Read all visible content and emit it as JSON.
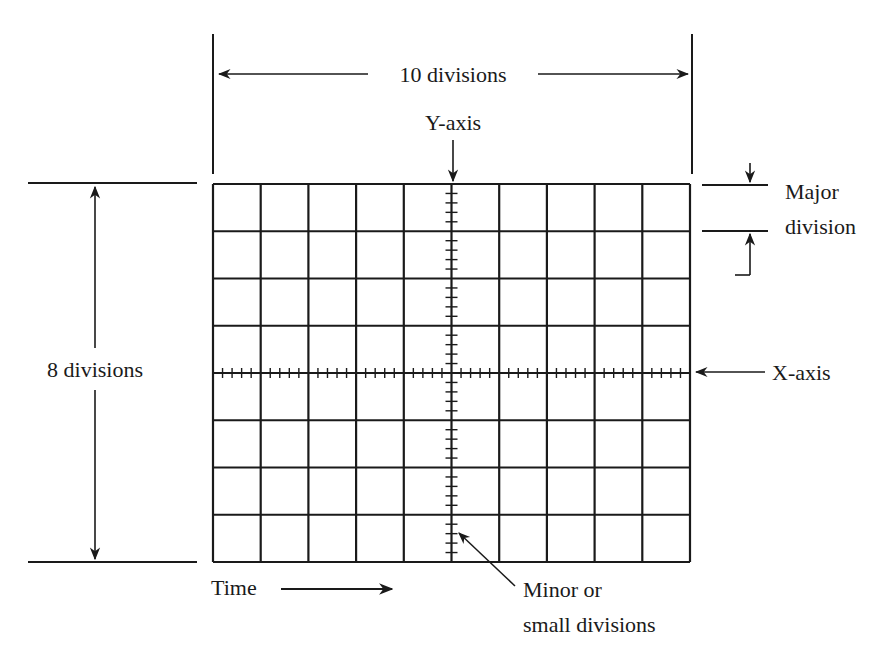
{
  "diagram": {
    "type": "oscilloscope-graticule",
    "grid": {
      "major_divisions_x": 10,
      "major_divisions_y": 8,
      "minor_per_major": 5
    },
    "labels": {
      "horizontal_span": "10 divisions",
      "vertical_span": "8 divisions",
      "y_axis": "Y-axis",
      "x_axis": "X-axis",
      "major_division_line1": "Major",
      "major_division_line2": "division",
      "time": "Time",
      "minor_line1": "Minor or",
      "minor_line2": "small divisions"
    },
    "colors": {
      "ink": "#1a1a1a",
      "background": "#ffffff"
    }
  }
}
